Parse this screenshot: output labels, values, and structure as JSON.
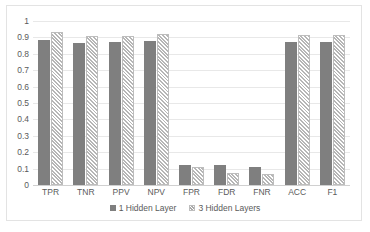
{
  "chart_data": {
    "type": "bar",
    "title": "",
    "subtitle": "",
    "xlabel": "",
    "ylabel": "",
    "ylim": [
      0,
      1
    ],
    "yticks": [
      "0",
      "0.1",
      "0.2",
      "0.3",
      "0.4",
      "0.5",
      "0.6",
      "0.7",
      "0.8",
      "0.9",
      "1"
    ],
    "ytick_values": [
      0,
      0.1,
      0.2,
      0.3,
      0.4,
      0.5,
      0.6,
      0.7,
      0.8,
      0.9,
      1
    ],
    "grid": "horizontal",
    "legend_position": "bottom",
    "categories": [
      "TPR",
      "TNR",
      "PPV",
      "NPV",
      "FPR",
      "FDR",
      "FNR",
      "ACC",
      "F1"
    ],
    "series": [
      {
        "name": "1 Hidden Layer",
        "color": "#7f7f7f",
        "fill": "solid",
        "values": [
          0.885,
          0.863,
          0.87,
          0.878,
          0.125,
          0.12,
          0.11,
          0.873,
          0.87
        ]
      },
      {
        "name": "3 Hidden Layers",
        "color": "#e6e6e6",
        "fill": "crosshatch",
        "values": [
          0.935,
          0.908,
          0.91,
          0.918,
          0.11,
          0.075,
          0.065,
          0.912,
          0.912
        ]
      }
    ],
    "annotations": []
  },
  "legend": {
    "items": [
      {
        "label": "1 Hidden Layer"
      },
      {
        "label": "3 Hidden Layers"
      }
    ]
  }
}
